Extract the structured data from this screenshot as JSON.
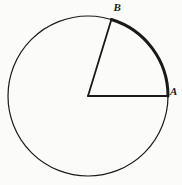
{
  "figure": {
    "kind": "circle-central-angle-diagram",
    "background_color": "#fbfbfa",
    "stroke_color": "#1a1a1a",
    "width": 182,
    "height": 185
  },
  "labels": {
    "point_b": "B",
    "point_a": "A"
  },
  "chart_data": {
    "type": "diagram",
    "title": "",
    "geometry": {
      "circle": {
        "center_x": 88,
        "center_y": 96,
        "radius": 80,
        "stroke_width": 1.2,
        "fill": "none"
      },
      "highlighted_arc": {
        "from_point": "A",
        "to_point": "B",
        "start_angle_deg": 0,
        "end_angle_deg": 73,
        "direction": "counterclockwise",
        "stroke_width": 3,
        "description": "bold minor arc AB drawn on upper-right of circle"
      },
      "radii": [
        {
          "name": "radius-to-A",
          "from": "center",
          "to": "A",
          "angle_deg": 0,
          "stroke_width": 1.8
        },
        {
          "name": "radius-to-B",
          "from": "center",
          "to": "B",
          "angle_deg": 73,
          "stroke_width": 1.8
        }
      ],
      "points": [
        {
          "name": "A",
          "x": 168,
          "y": 96,
          "angle_deg": 0,
          "label_offset": [
            2,
            -10
          ]
        },
        {
          "name": "B",
          "x": 111,
          "y": 20,
          "angle_deg": 73,
          "label_offset": [
            2,
            -17
          ]
        }
      ],
      "central_angle_deg": 73
    }
  }
}
